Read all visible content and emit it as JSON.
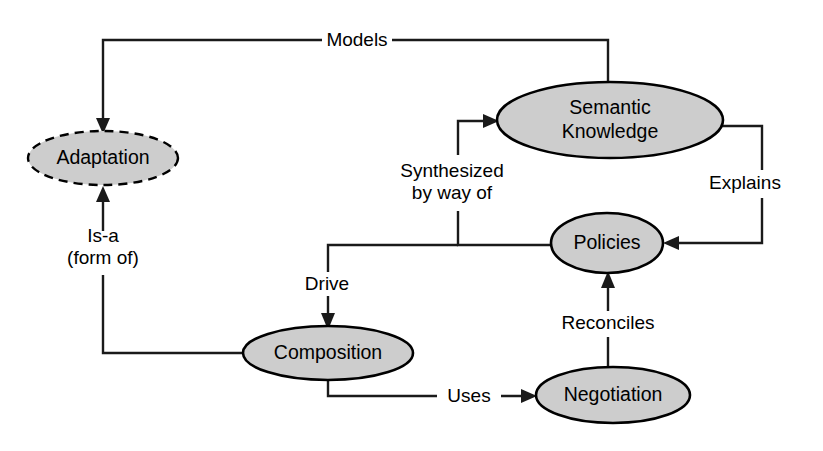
{
  "diagram": {
    "type": "concept-relationship-diagram",
    "background_color": "#ffffff",
    "node_fill_color": "#cdcdcd",
    "node_stroke_color": "#000000",
    "edge_color": "#1a1a1a",
    "nodes": [
      {
        "id": "adaptation",
        "label": "Adaptation",
        "shape": "ellipse",
        "border_style": "dashed",
        "cx": 103,
        "cy": 158,
        "rx": 75,
        "ry": 27
      },
      {
        "id": "semantic_knowledge",
        "label_line1": "Semantic",
        "label_line2": "Knowledge",
        "label": "Semantic Knowledge",
        "shape": "ellipse",
        "border_style": "solid",
        "cx": 610,
        "cy": 120,
        "rx": 113,
        "ry": 38
      },
      {
        "id": "policies",
        "label": "Policies",
        "shape": "ellipse",
        "border_style": "solid",
        "cx": 607,
        "cy": 243,
        "rx": 56,
        "ry": 30
      },
      {
        "id": "composition",
        "label": "Composition",
        "shape": "ellipse",
        "border_style": "solid",
        "cx": 328,
        "cy": 353,
        "rx": 85,
        "ry": 27
      },
      {
        "id": "negotiation",
        "label": "Negotiation",
        "shape": "ellipse",
        "border_style": "solid",
        "cx": 613,
        "cy": 395,
        "rx": 77,
        "ry": 28
      }
    ],
    "edges": [
      {
        "id": "models",
        "label": "Models",
        "from": "semantic_knowledge",
        "to": "adaptation",
        "label_x": 357,
        "label_y": 40
      },
      {
        "id": "is_a",
        "label_line1": "Is-a",
        "label_line2": "(form of)",
        "label": "Is-a (form of)",
        "from": "composition",
        "to": "adaptation",
        "label_x": 103,
        "label_y": 247
      },
      {
        "id": "synthesized_by_way_of",
        "label_line1": "Synthesized",
        "label_line2": "by way of",
        "label": "Synthesized by way of",
        "from": "policies",
        "to": "semantic_knowledge",
        "label_x": 452,
        "label_y": 182
      },
      {
        "id": "explains",
        "label": "Explains",
        "from": "semantic_knowledge",
        "to": "policies",
        "label_x": 745,
        "label_y": 183
      },
      {
        "id": "drive",
        "label": "Drive",
        "from": "policies",
        "to": "composition",
        "label_x": 327,
        "label_y": 284
      },
      {
        "id": "uses",
        "label": "Uses",
        "from": "composition",
        "to": "negotiation",
        "label_x": 469,
        "label_y": 396
      },
      {
        "id": "reconciles",
        "label": "Reconciles",
        "from": "negotiation",
        "to": "policies",
        "label_x": 608,
        "label_y": 323
      }
    ]
  }
}
